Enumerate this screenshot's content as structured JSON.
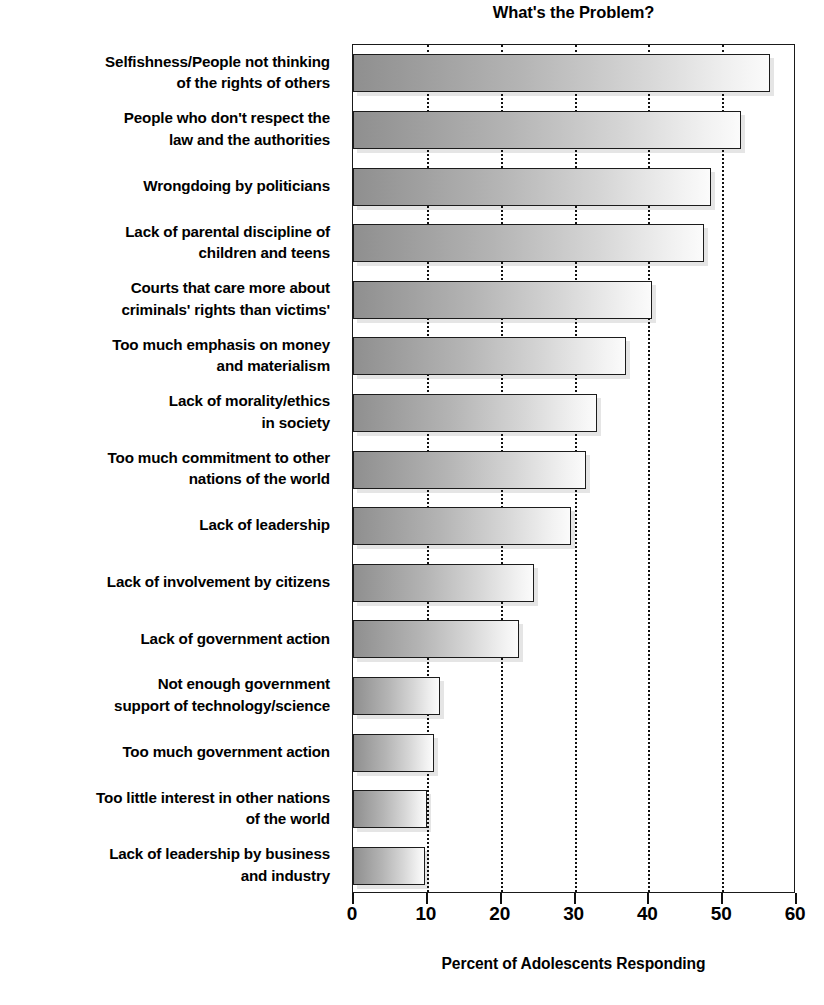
{
  "chart_data": {
    "type": "bar",
    "orientation": "horizontal",
    "title": "What's the Problem?",
    "xlabel": "Percent of Adolescents Responding",
    "ylabel": "",
    "xlim": [
      0,
      60
    ],
    "xticks": [
      0,
      10,
      20,
      30,
      40,
      50,
      60
    ],
    "xtick_labels": [
      "0",
      "10",
      "20",
      "30",
      "40",
      "50",
      "60"
    ],
    "grid": "vertical-dotted",
    "legend": "none",
    "bar_style": {
      "fill_gradient_start": "#8f8f8f",
      "fill_gradient_end": "#fbfbfb",
      "border_color": "#1c1c1c",
      "shadow_color": "#d9d9d9"
    },
    "categories": [
      "Selfishness/People not thinking\nof the rights of others",
      "People who don't respect the\nlaw and the authorities",
      "Wrongdoing by politicians",
      "Lack of parental discipline of\nchildren and teens",
      "Courts that care more about\ncriminals' rights than victims'",
      "Too much emphasis on money\nand materialism",
      "Lack of morality/ethics\nin society",
      "Too much commitment to other\nnations of the world",
      "Lack of leadership",
      "Lack of involvement by citizens",
      "Lack of government action",
      "Not enough government\nsupport of technology/science",
      "Too much government action",
      "Too little interest in other nations\nof the world",
      "Lack of leadership by business\nand industry"
    ],
    "values": [
      56.5,
      52.5,
      48.5,
      47.5,
      40.5,
      37.0,
      33.0,
      31.5,
      29.5,
      24.5,
      22.5,
      11.8,
      11.0,
      10.0,
      9.7
    ]
  }
}
